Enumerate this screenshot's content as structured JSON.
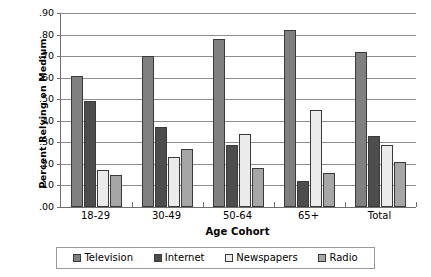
{
  "chart_data": {
    "type": "bar",
    "title": "",
    "subtitle": "",
    "xlabel": "Age Cohort",
    "ylabel": "Percent Relying on Medium",
    "categories": [
      "18-29",
      "30-49",
      "50-64",
      "65+",
      "Total"
    ],
    "series": [
      {
        "name": "Television",
        "color": "#808080",
        "values": [
          0.61,
          0.7,
          0.78,
          0.82,
          0.72
        ]
      },
      {
        "name": "Internet",
        "color": "#4d4d4d",
        "values": [
          0.49,
          0.37,
          0.29,
          0.12,
          0.33
        ]
      },
      {
        "name": "Newspapers",
        "color": "#ebebeb",
        "values": [
          0.17,
          0.23,
          0.34,
          0.45,
          0.29
        ]
      },
      {
        "name": "Radio",
        "color": "#a6a6a6",
        "values": [
          0.15,
          0.27,
          0.18,
          0.16,
          0.21
        ]
      }
    ],
    "ylim": [
      0.0,
      0.9
    ],
    "ytick_step": 0.1,
    "ytick_labels": [
      ".00",
      ".10",
      ".20",
      ".30",
      ".40",
      ".50",
      ".60",
      ".70",
      ".80",
      ".90"
    ],
    "grid": "horizontal",
    "legend_position": "bottom",
    "bar_border_color": "#3a3a3a",
    "axis_color": "#6f6f6f",
    "gridline_color": "#8d8d8d"
  },
  "axes": {
    "y_title": "Percent Relying on Medium",
    "x_title": "Age Cohort"
  },
  "legend": {
    "items": [
      {
        "label": "Television"
      },
      {
        "label": "Internet"
      },
      {
        "label": "Newspapers"
      },
      {
        "label": "Radio"
      }
    ]
  }
}
